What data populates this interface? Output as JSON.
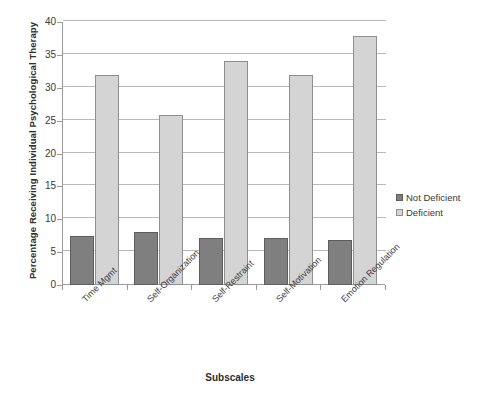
{
  "title_faint": "",
  "axis": {
    "y_title": "Percentage Receiving Individual Psychological Therapy",
    "x_title": "Subscales",
    "y_ticks": [
      "0",
      "5",
      "10",
      "15",
      "20",
      "25",
      "30",
      "35",
      "40"
    ]
  },
  "legend": {
    "position": "right",
    "items": [
      {
        "label": "Not Deficient",
        "color": "#7f7f7f",
        "icon": "square-swatch-icon"
      },
      {
        "label": "Deficient",
        "color": "#d4d4d4",
        "icon": "square-swatch-icon"
      }
    ]
  },
  "chart_data": {
    "type": "bar",
    "title": "",
    "xlabel": "Subscales",
    "ylabel": "Percentage Receiving Individual Psychological Therapy",
    "ylim": [
      0,
      40
    ],
    "ytick_step": 5,
    "grid": true,
    "legend_position": "right",
    "categories": [
      "Time Mgmt",
      "Self-Organization",
      "Self-Restraint",
      "Self-Motivation",
      "Emotion Regulation"
    ],
    "series": [
      {
        "name": "Not Deficient",
        "color": "#7f7f7f",
        "values": [
          7.4,
          8.1,
          7.1,
          7.2,
          6.9
        ]
      },
      {
        "name": "Deficient",
        "color": "#d4d4d4",
        "values": [
          32.0,
          25.8,
          34.0,
          32.0,
          37.9
        ]
      }
    ]
  }
}
